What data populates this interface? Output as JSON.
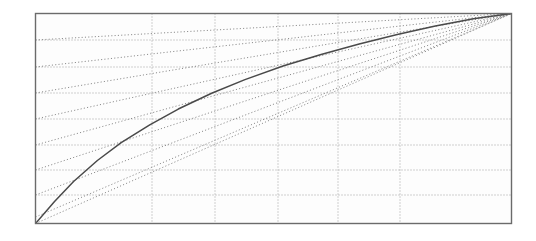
{
  "figure": {
    "background_color": "#ffffff",
    "frame": {
      "name": "plot-frame",
      "x0": 35.5,
      "y0": 13.5,
      "x1": 511.5,
      "y1": 223.5,
      "stroke": "#6b6b6b",
      "stroke_width": 1.4
    },
    "plot_interior_fill": "#fdfdfd"
  },
  "chart_data": {
    "type": "line",
    "title": "",
    "subtitle": "",
    "xlabel": "",
    "ylabel": "",
    "xlim": [
      0,
      1
    ],
    "ylim": [
      0,
      1
    ],
    "grid": true,
    "grid_style": "dotted",
    "legend": null,
    "legend_position": "none",
    "annotations": [],
    "gridlines": {
      "color": "#9a9a9a",
      "dash": "1,2",
      "width": 0.9,
      "vertical_x": [
        152,
        215,
        278,
        338,
        400
      ],
      "horizontal_y": [
        40,
        67,
        93,
        119,
        145,
        170,
        195
      ]
    },
    "fan": {
      "name": "radiating-dotted-chords",
      "origin": [
        35.5,
        223.5
      ],
      "apex": [
        511.5,
        13.5
      ],
      "color": "#7d7d7d",
      "dash": "1.1,2.2",
      "width": 0.9,
      "comment": "Left-edge crossing heights of the lower chords, and top-edge crossing positions of the upper chords.",
      "left_edge_y": [
        217,
        195,
        170,
        145,
        119,
        93,
        67,
        40
      ],
      "top_edge_x": [
        430,
        444,
        456,
        466,
        474,
        481,
        487,
        492,
        497,
        500,
        503,
        506,
        508,
        510
      ]
    },
    "curve": {
      "name": "solid-concave-curve",
      "color": "#4a4a4a",
      "width": 1.5,
      "style": "solid",
      "x": [
        0.0,
        0.04,
        0.08,
        0.13,
        0.18,
        0.24,
        0.3,
        0.37,
        0.44,
        0.52,
        0.6,
        0.68,
        0.76,
        0.84,
        0.92,
        1.0
      ],
      "y": [
        0.0,
        0.105,
        0.2,
        0.3,
        0.385,
        0.47,
        0.545,
        0.62,
        0.685,
        0.75,
        0.805,
        0.855,
        0.9,
        0.94,
        0.975,
        1.0
      ]
    }
  }
}
